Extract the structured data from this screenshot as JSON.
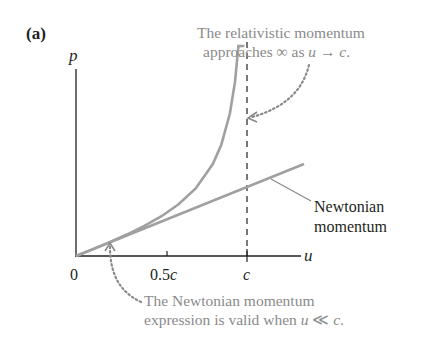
{
  "panel_label": "(a)",
  "chart_data": {
    "type": "line",
    "title": "",
    "xlabel": "u",
    "ylabel": "p",
    "x_ticks": [
      "0",
      "0.5c",
      "c"
    ],
    "x_tick_values": [
      0,
      0.5,
      1.0
    ],
    "xlim": [
      0,
      1.2
    ],
    "grid": false,
    "legend": "none (direct annotation)",
    "series": [
      {
        "name": "Relativistic momentum",
        "formula": "p = mu / sqrt(1 - u^2/c^2)",
        "x": [
          0,
          0.1,
          0.2,
          0.3,
          0.4,
          0.5,
          0.6,
          0.7,
          0.8,
          0.85,
          0.9,
          0.93,
          0.95,
          0.97,
          0.985
        ],
        "y": [
          0,
          0.1005,
          0.2041,
          0.3145,
          0.4364,
          0.5774,
          0.75,
          0.9802,
          1.3333,
          1.6135,
          2.0647,
          2.5226,
          3.0424,
          3.9903,
          5.7
        ],
        "color": "#a0a0a0"
      },
      {
        "name": "Newtonian momentum",
        "formula": "p = mu",
        "x": [
          0,
          1.2
        ],
        "y": [
          0,
          1.2
        ],
        "color": "#a0a0a0"
      }
    ],
    "reference_lines": [
      {
        "type": "vertical",
        "x": 1.0,
        "style": "dashed",
        "label": "c"
      }
    ],
    "annotations": [
      {
        "text": "The relativistic momentum approaches ∞ as u → c.",
        "points_to": "relativistic curve near u = c"
      },
      {
        "text": "Newtonian momentum",
        "points_to": "Newtonian line"
      },
      {
        "text": "The Newtonian momentum expression is valid when u ≪ c.",
        "points_to": "curves overlapping near origin"
      }
    ]
  },
  "labels": {
    "y_axis": "p",
    "x_axis": "u",
    "tick_0": "0",
    "tick_half_c_num": "0.5",
    "tick_half_c_var": "c",
    "tick_c": "c",
    "newtonian_line1": "Newtonian",
    "newtonian_line2": "momentum",
    "rel_note_line1": "The relativistic momentum",
    "rel_note_line2_a": "approaches ∞ as ",
    "rel_note_line2_u": "u",
    "rel_note_line2_arrow": " → ",
    "rel_note_line2_c": "c",
    "rel_note_line2_end": ".",
    "newt_note_line1": "The Newtonian momentum",
    "newt_note_line2_a": "expression is valid when ",
    "newt_note_line2_u": "u",
    "newt_note_line2_ll": " ≪ ",
    "newt_note_line2_c": "c",
    "newt_note_line2_end": "."
  }
}
